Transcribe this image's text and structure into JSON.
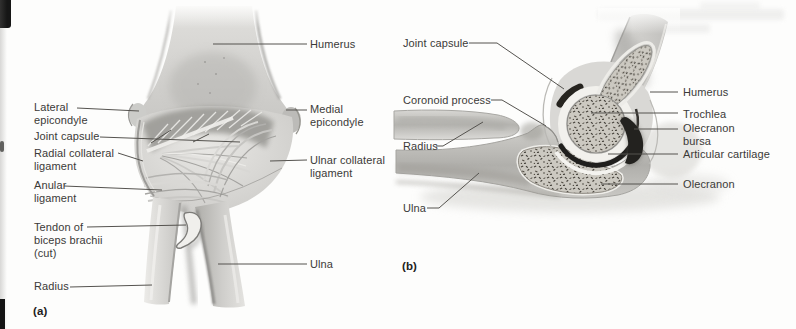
{
  "figure": {
    "type": "anatomical-diagram"
  },
  "colors": {
    "page_background": "#fdfdfc",
    "label_text": "#3b3a38",
    "leader_line": "#55534f",
    "dark_joint_cavity": "#21201d",
    "bone_light": "#dcdbd8",
    "bone_mid": "#c4c3c0"
  },
  "panel_a": {
    "caption": "(a)",
    "labels": {
      "humerus": "Humerus",
      "lateral_epicondyle": "Lateral\nepicondyle",
      "medial_epicondyle": "Medial\nepicondyle",
      "joint_capsule": "Joint capsule",
      "radial_collateral_ligament": "Radial collateral\nligament",
      "ulnar_collateral_ligament": "Ulnar collateral\nligament",
      "anular_ligament": "Anular\nligament",
      "tendon_of_biceps_brachii_cut": "Tendon of\nbiceps brachii\n(cut)",
      "ulna": "Ulna",
      "radius": "Radius"
    }
  },
  "panel_b": {
    "caption": "(b)",
    "labels": {
      "joint_capsule": "Joint capsule",
      "coronoid_process": "Coronoid process",
      "radius": "Radius",
      "ulna": "Ulna",
      "humerus": "Humerus",
      "trochlea": "Trochlea",
      "olecranon_bursa": "Olecranon\nbursa",
      "articular_cartilage": "Articular cartilage",
      "olecranon": "Olecranon"
    }
  }
}
